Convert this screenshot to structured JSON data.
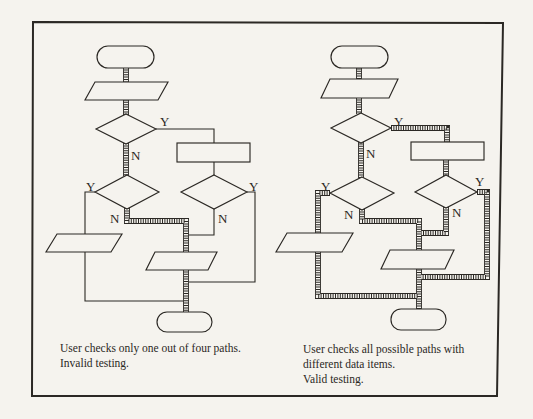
{
  "colors": {
    "paper": "#f5f3ee",
    "ink": "#2b2824"
  },
  "left_chart": {
    "labels": {
      "d1_yes": "Y",
      "d1_no": "N",
      "d2_yes": "Y",
      "d2_no": "N",
      "d3_yes": "Y",
      "d3_no": "N"
    },
    "caption": {
      "line1": "User checks only one out of four paths.",
      "line2": "Invalid testing."
    }
  },
  "right_chart": {
    "labels": {
      "d1_yes": "Y",
      "d1_no": "N",
      "d2_yes": "Y",
      "d2_no": "N",
      "d3_yes": "Y",
      "d3_no": "N"
    },
    "caption": {
      "line1": "User checks all possible paths with",
      "line2": "different data items.",
      "line3": "Valid testing."
    }
  }
}
